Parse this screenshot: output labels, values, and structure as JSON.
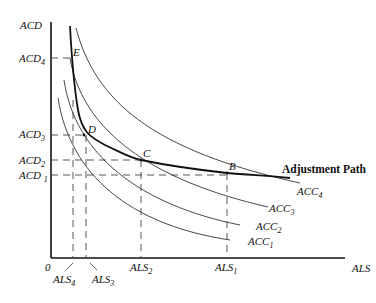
{
  "diagram": {
    "axes": {
      "y_label": "ACD",
      "x_label": "ALS",
      "origin": "0"
    },
    "y_ticks": [
      {
        "base": "ACD",
        "sub": "4"
      },
      {
        "base": "ACD",
        "sub": "3"
      },
      {
        "base": "ACD",
        "sub": "2"
      },
      {
        "base": "ACD ",
        "sub": "1"
      }
    ],
    "x_ticks": [
      {
        "base": "ALS",
        "sub": "4"
      },
      {
        "base": "ALS",
        "sub": "3"
      },
      {
        "base": "ALS",
        "sub": "2"
      },
      {
        "base": "ALS",
        "sub": "1"
      }
    ],
    "points": {
      "E": "E",
      "D": "D",
      "C": "C",
      "B": "B"
    },
    "curves": [
      {
        "base": "ACC",
        "sub": "4"
      },
      {
        "base": "ACC",
        "sub": "3"
      },
      {
        "base": "ACC",
        "sub": "2"
      },
      {
        "base": "ACC",
        "sub": "1"
      }
    ],
    "path_label": "Adjustment Path"
  }
}
